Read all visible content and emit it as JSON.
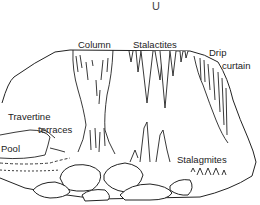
{
  "diagram": {
    "top_mark": "U",
    "labels": {
      "column": "Column",
      "stalactites": "Stalactites",
      "drip_curtain_line1": "Drip",
      "drip_curtain_line2": "curtain",
      "travertine_line1": "Travertine",
      "travertine_line2": "terraces",
      "pool": "Pool",
      "stalagmites": "Stalagmites"
    },
    "colors": {
      "ink": "#222222",
      "background": "#ffffff"
    }
  }
}
